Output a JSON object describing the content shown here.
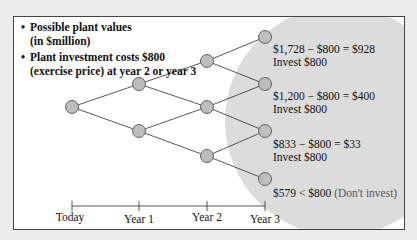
{
  "notes": [
    {
      "line1": "Possible plant values",
      "line2": "(in $million)"
    },
    {
      "line1": "Plant investment costs $800",
      "line2": "(exercise price) at year 2 or year 3"
    }
  ],
  "bullet_glyph": "•",
  "outcomes": [
    {
      "calc": "$1,728 − $800 = $928",
      "action": "Invest $800"
    },
    {
      "calc": "$1,200 − $800 = $400",
      "action": "Invest $800"
    },
    {
      "calc": "$833 − $800 = $33",
      "action": "Invest $800"
    },
    {
      "calc": "$579 < $800",
      "action": "(Don't invest)"
    }
  ],
  "timeline": [
    "Today",
    "Year 1",
    "Year 2",
    "Year 3"
  ],
  "colors": {
    "node_fill": "#bdbdbd",
    "node_stroke": "#555555",
    "shade": "#dcdcdc",
    "line": "#444444"
  }
}
